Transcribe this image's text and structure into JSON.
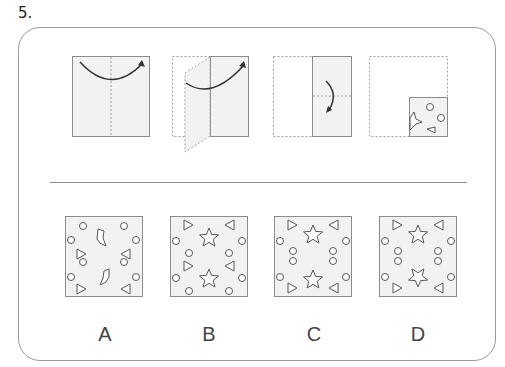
{
  "question": {
    "number": "5."
  },
  "colors": {
    "paper_fill": "#f2f2f2",
    "paper_stroke": "#8c8c8c",
    "dotted_stroke": "#a0a0a0",
    "arrow": "#333333",
    "shape_stroke": "#555555"
  },
  "steps": [
    {
      "id": "step-1",
      "description": "Full square, fold left half over to right along vertical center line"
    },
    {
      "id": "step-2",
      "description": "Left half folding over onto right half"
    },
    {
      "id": "step-3",
      "description": "Right half rectangle, fold top down along horizontal center line"
    },
    {
      "id": "step-4",
      "description": "Quarter square with punched shapes: star-fragment, two circles, triangle"
    }
  ],
  "options": [
    {
      "letter": "A",
      "description": "Irregular shard shapes with circles and triangles"
    },
    {
      "letter": "B",
      "description": "Two stars, circles, triangles"
    },
    {
      "letter": "C",
      "description": "Two stars, paired circles, triangles"
    },
    {
      "letter": "D",
      "description": "Two stars (rotated), paired circles, triangles"
    }
  ]
}
